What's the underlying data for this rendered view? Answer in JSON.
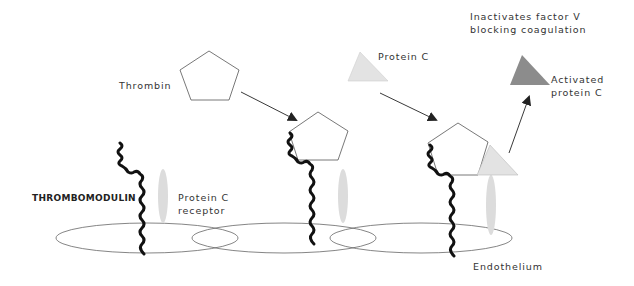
{
  "labels": {
    "thrombin": "Thrombin",
    "protein_c": "Protein C",
    "inactivates_line1": "Inactivates factor V",
    "inactivates_line2": "blocking coagulation",
    "activated_line1": "Activated",
    "activated_line2": "protein C",
    "thrombomodulin": "THROMBOMODULIN",
    "receptor_line1": "Protein C",
    "receptor_line2": "receptor",
    "endothelium": "Endothelium"
  },
  "colors": {
    "outline": "#555555",
    "strand": "#111111",
    "protein_c_fill": "#e3e3e3",
    "activated_fill": "#8c8c8c",
    "receptor_fill": "#dcdcdc",
    "arrow": "#222222"
  }
}
